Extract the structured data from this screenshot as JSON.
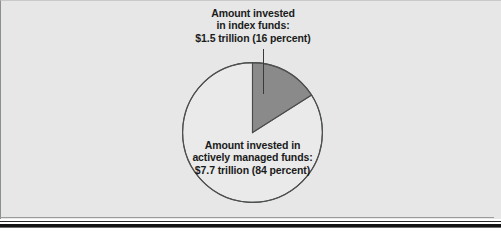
{
  "figure": {
    "background_color": "#e6e7e6",
    "page_color": "#ffffff"
  },
  "labels": {
    "index": {
      "line1": "Amount invested",
      "line2": "in index funds:",
      "line3": "$1.5 trillion (16 percent)"
    },
    "active": {
      "line1": "Amount invested in",
      "line2": "actively managed funds:",
      "line3": "$7.7 trillion (84 percent)"
    }
  },
  "chart_data": {
    "type": "pie",
    "title": "",
    "categories": [
      "Index funds",
      "Actively managed funds"
    ],
    "values": [
      16,
      84
    ],
    "value_labels": [
      "$1.5 trillion (16 percent)",
      "$7.7 trillion (84 percent)"
    ],
    "amounts_trillions": [
      1.5,
      7.7
    ],
    "percentages": [
      16,
      84
    ],
    "unit": "trillion US dollars",
    "colors": [
      "#8a8a8a",
      "#e9eae9"
    ],
    "slice_edge_color": "#4a4a4a",
    "start_angle_deg": 0,
    "direction": "clockwise",
    "legend": "none",
    "annotations": [
      "Amount invested in index funds: $1.5 trillion (16 percent)",
      "Amount invested in actively managed funds: $7.7 trillion (84 percent)"
    ]
  }
}
